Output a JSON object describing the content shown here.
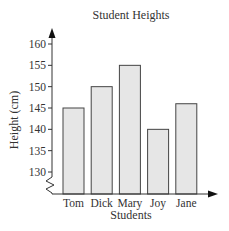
{
  "chart_data": {
    "type": "bar",
    "title": "Student Heights",
    "xlabel": "Students",
    "ylabel": "Height (cm)",
    "categories": [
      "Tom",
      "Dick",
      "Mary",
      "Joy",
      "Jane"
    ],
    "values": [
      145,
      150,
      155,
      140,
      146
    ],
    "yticks": [
      130,
      135,
      140,
      145,
      150,
      155,
      160
    ],
    "ylim": [
      125,
      162
    ],
    "axis_break": true,
    "grid": false,
    "legend": null,
    "bar_color": "#e6e6e6",
    "bar_edge_color": "#444444"
  }
}
